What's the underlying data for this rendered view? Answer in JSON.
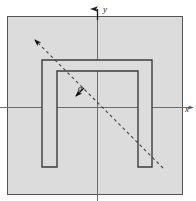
{
  "figure": {
    "title": "",
    "background_color": "#ffffff",
    "plate": {
      "name": "gray-plate",
      "fill_color": "#dcdcdc",
      "stroke_color": "#555555",
      "x": 7,
      "y": 16,
      "width": 175,
      "height": 178
    },
    "axes": {
      "origin_x": 97,
      "origin_y": 107,
      "stroke_color": "#6d6d6d",
      "x_axis": {
        "label": "x",
        "label_x": 185,
        "label_y": 112,
        "start_x": 0,
        "end_x": 193,
        "y": 107
      },
      "y_axis": {
        "label": "y",
        "label_x": 103,
        "label_y": 12,
        "x": 97,
        "start_y": 201,
        "end_y": 7
      }
    },
    "u_shape": {
      "name": "u-channel-outline",
      "fill_color": "#dcdcdc",
      "stroke_color": "#3d3d3d",
      "outer_left": 42,
      "outer_right": 152,
      "outer_top": 60,
      "outer_bottom": 167,
      "inner_left": 57,
      "inner_right": 138,
      "inner_top": 71,
      "notch_bottom": 153
    },
    "dashed_line": {
      "name": "axis-of-symmetry-dashed-line",
      "stroke_color": "#444444",
      "dash_pattern": "3 3",
      "x1": 163,
      "y1": 168,
      "x2": 33,
      "y2": 38,
      "arrow_at": "top-left"
    },
    "angle": {
      "symbol": "α",
      "label_x": 78,
      "label_y": 91,
      "pointer_x": 76,
      "pointer_y": 96
    }
  }
}
